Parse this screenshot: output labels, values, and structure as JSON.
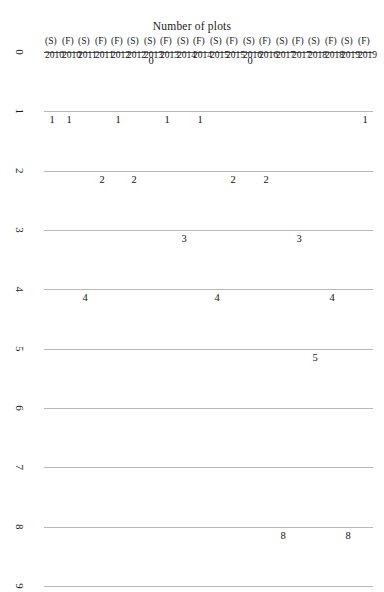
{
  "chart_data": {
    "type": "bar",
    "orientation": "horizontal-rotated",
    "title": "",
    "xlabel": "",
    "ylabel": "Number of plots",
    "ylim": [
      0,
      9
    ],
    "grid": true,
    "legend": "none",
    "tick_labels": [
      "0",
      "1",
      "2",
      "3",
      "4",
      "5",
      "6",
      "7",
      "8",
      "9"
    ],
    "categories": [
      "2010 (S)",
      "2010 (F)",
      "2011 (S)",
      "2011 (F)",
      "2012 (F)",
      "2012 (S)",
      "2013 (S)",
      "2013 (F)",
      "2014 (S)",
      "2014 (F)",
      "2015 (S)",
      "2015 (F)",
      "2016 (S)",
      "2016 (F)",
      "2017 (S)",
      "2017 (F)",
      "2018 (S)",
      "2018 (F)",
      "2019 (S)",
      "2019 (F)"
    ],
    "values": [
      1,
      1,
      4,
      2,
      1,
      2,
      0,
      1,
      3,
      1,
      4,
      2,
      0,
      2,
      8,
      3,
      5,
      4,
      8,
      1
    ],
    "bars": [
      {
        "year": "2010",
        "season": "(S)",
        "value": 1,
        "series": "S",
        "color": "#262626",
        "label": "1"
      },
      {
        "year": "2010",
        "season": "(F)",
        "value": 1,
        "series": "F",
        "color": "#808080",
        "label": "1"
      },
      {
        "year": "2011",
        "season": "(S)",
        "value": 4,
        "series": "S",
        "color": "#262626",
        "label": "4"
      },
      {
        "year": "2011",
        "season": "(F)",
        "value": 2,
        "series": "F",
        "color": "#808080",
        "label": "2"
      },
      {
        "year": "2012",
        "season": "(F)",
        "value": 1,
        "series": "S",
        "color": "#262626",
        "label": "1"
      },
      {
        "year": "2012",
        "season": "(S)",
        "value": 2,
        "series": "F",
        "color": "#808080",
        "label": "2"
      },
      {
        "year": "2013",
        "season": "(S)",
        "value": 0,
        "series": "S",
        "color": "#262626",
        "label": "0"
      },
      {
        "year": "2013",
        "season": "(F)",
        "value": 1,
        "series": "F",
        "color": "#808080",
        "label": "1"
      },
      {
        "year": "2014",
        "season": "(S)",
        "value": 3,
        "series": "S",
        "color": "#262626",
        "label": "3"
      },
      {
        "year": "2014",
        "season": "(F)",
        "value": 1,
        "series": "F",
        "color": "#808080",
        "label": "1"
      },
      {
        "year": "2015",
        "season": "(S)",
        "value": 4,
        "series": "S",
        "color": "#262626",
        "label": "4"
      },
      {
        "year": "2015",
        "season": "(F)",
        "value": 2,
        "series": "F",
        "color": "#808080",
        "label": "2"
      },
      {
        "year": "2016",
        "season": "(S)",
        "value": 0,
        "series": "S",
        "color": "#262626",
        "label": "0"
      },
      {
        "year": "2016",
        "season": "(F)",
        "value": 2,
        "series": "F",
        "color": "#808080",
        "label": "2"
      },
      {
        "year": "2017",
        "season": "(S)",
        "value": 8,
        "series": "S",
        "color": "#262626",
        "label": "8"
      },
      {
        "year": "2017",
        "season": "(F)",
        "value": 3,
        "series": "F",
        "color": "#808080",
        "label": "3"
      },
      {
        "year": "2018",
        "season": "(S)",
        "value": 5,
        "series": "S",
        "color": "#262626",
        "label": "5"
      },
      {
        "year": "2018",
        "season": "(F)",
        "value": 4,
        "series": "F",
        "color": "#808080",
        "label": "4"
      },
      {
        "year": "2019",
        "season": "(S)",
        "value": 8,
        "series": "S",
        "color": "#262626",
        "label": "8"
      },
      {
        "year": "2019",
        "season": "(F)",
        "value": 1,
        "series": "F",
        "color": "#808080",
        "label": "1"
      }
    ],
    "colors": {
      "spring_bar": "#262626",
      "fall_bar": "#808080",
      "gridline": "#b9b9b9",
      "axis": "#555555",
      "background": "#ffffff",
      "text": "#1a1a1a"
    }
  }
}
